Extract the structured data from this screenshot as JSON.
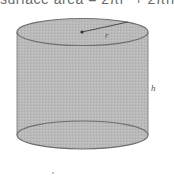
{
  "formula": {
    "text": "surface area = 2πr² + 2πrh"
  },
  "diagram": {
    "shape": "cylinder",
    "labels": {
      "radius": "r",
      "height": "h"
    },
    "colors": {
      "fill": "#b9b9b9",
      "outline": "#6e6e6e",
      "background": "#ffffff"
    }
  }
}
